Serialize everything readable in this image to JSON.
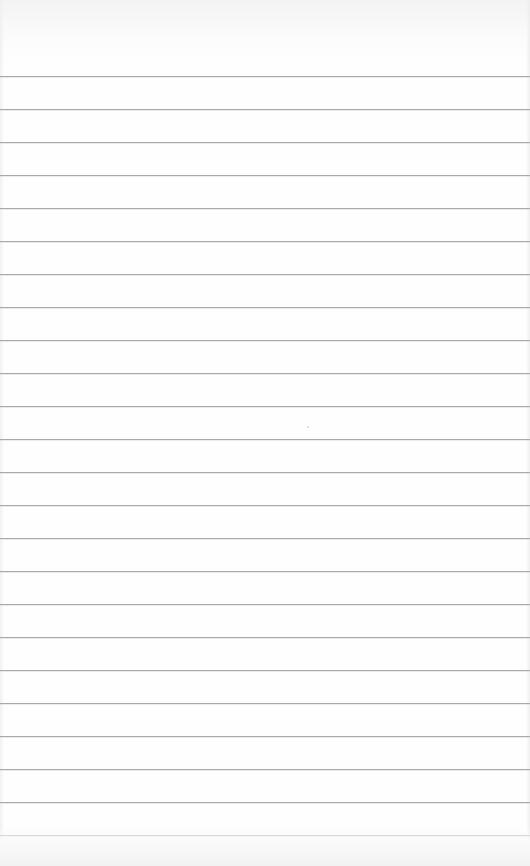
{
  "page": {
    "type": "lined-paper",
    "width": 530,
    "height": 866,
    "background_color": "#fefefe",
    "line_color": "#a9a9a9",
    "line_count": 24,
    "first_line_y": 76,
    "line_spacing": 33,
    "text": ""
  }
}
